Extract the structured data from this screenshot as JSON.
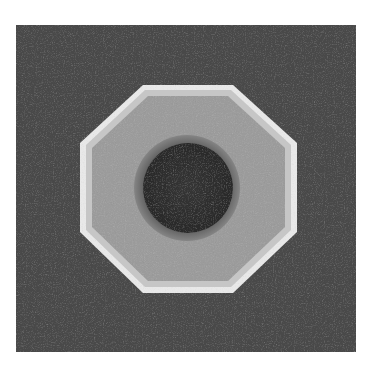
{
  "image": {
    "description": "Grayscale photo of an octagonal element with a dark circular core, on a dark textured square background",
    "colors": {
      "page_background": "#ffffff",
      "square_background": "#4a4a4a",
      "octagon_fill": "#9a9a9a",
      "octagon_rim_light": "#e6e6e6",
      "ring": "#6e6e6e",
      "core": "#303030"
    }
  }
}
